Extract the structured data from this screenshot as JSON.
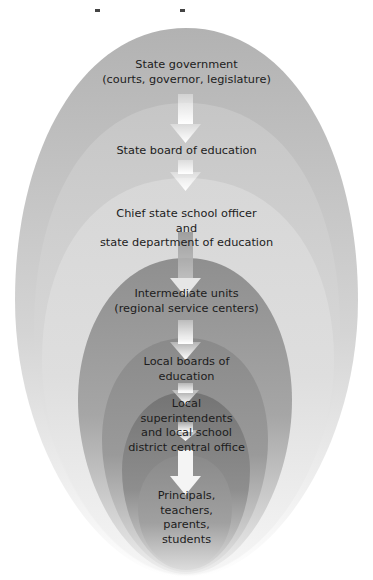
{
  "diagram": {
    "type": "nested-ellipses-hierarchy",
    "colors": {
      "level1": "#b4b4b4",
      "level2": "#c9c9c9",
      "level3": "#d9d9d9",
      "level4": "#9c9c9c",
      "level5": "#8c8c8c",
      "level6": "#7c7c7c",
      "level7": "#8e8e8e",
      "arrow": "#f4f4f4",
      "text": "#1c1c1c"
    },
    "levels": [
      {
        "line1": "State government",
        "line2": "(courts, governor, legislature)"
      },
      {
        "line1": "State board of education"
      },
      {
        "line1": "Chief state school officer",
        "line2": "and",
        "line3": "state department of education"
      },
      {
        "line1": "Intermediate units",
        "line2": "(regional service centers)"
      },
      {
        "line1": "Local boards of",
        "line2": "education"
      },
      {
        "line1": "Local",
        "line2": "superintendents",
        "line3": "and local school",
        "line4": "district central office"
      },
      {
        "line1": "Principals,",
        "line2": "teachers,",
        "line3": "parents,",
        "line4": "students"
      }
    ]
  }
}
